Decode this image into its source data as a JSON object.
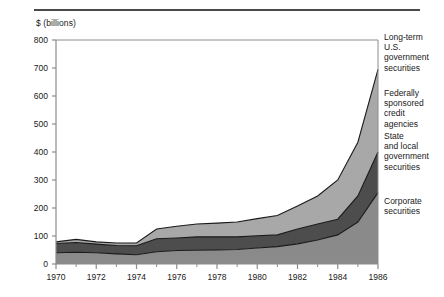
{
  "header": {
    "rule": true
  },
  "axes": {
    "ylabel": "$ (billions)",
    "yticks": [
      0,
      100,
      200,
      300,
      400,
      500,
      600,
      700,
      800
    ],
    "xticks": [
      1970,
      1972,
      1974,
      1976,
      1978,
      1980,
      1982,
      1984,
      1986
    ],
    "xticks_minor": [
      1971,
      1973,
      1975,
      1977,
      1979,
      1981,
      1983,
      1985
    ]
  },
  "legend": {
    "items": [
      {
        "label": "Long-term\nU.S.\ngovernment\nsecurities",
        "lines": [
          "Long-term",
          "U.S.",
          "government",
          "securities"
        ],
        "color": "#ffffff"
      },
      {
        "label": "Federally\nsponsored\ncredit\nagencies",
        "lines": [
          "Federally",
          "sponsored",
          "credit",
          "agencies"
        ],
        "color": "#a8a8a8"
      },
      {
        "label": "State\nand local\ngovernment\nsecurities",
        "lines": [
          "State",
          "and local",
          "government",
          "securities"
        ],
        "color": "#4d4d4d"
      },
      {
        "label": "Corporate\nsecurities",
        "lines": [
          "Corporate",
          "securities"
        ],
        "color": "#8a8a8a"
      }
    ]
  },
  "colors": {
    "corporate": "#8a8a8a",
    "state_local": "#4d4d4d",
    "federal_credit": "#a8a8a8",
    "longterm_govt": "#ffffff",
    "axis": "#8c8c8c",
    "outline": "#1a1a1a",
    "rule": "#4a4a4a",
    "text": "#1a1a1a"
  },
  "chart_data": {
    "type": "area",
    "title": "",
    "subtitle": "",
    "xlabel": "",
    "ylabel": "$ (billions)",
    "stacked": true,
    "grid": false,
    "legend_position": "right",
    "xlim": [
      1970,
      1986
    ],
    "ylim": [
      0,
      800
    ],
    "x": [
      1970,
      1971,
      1972,
      1973,
      1974,
      1975,
      1976,
      1977,
      1978,
      1979,
      1980,
      1981,
      1982,
      1983,
      1984,
      1985,
      1986
    ],
    "series": [
      {
        "name": "Corporate securities",
        "color": "#8a8a8a",
        "values": [
          40,
          42,
          40,
          36,
          33,
          44,
          48,
          49,
          50,
          52,
          57,
          62,
          72,
          86,
          104,
          150,
          255
        ]
      },
      {
        "name": "State and local government securities",
        "color": "#4d4d4d",
        "values": [
          33,
          35,
          31,
          30,
          32,
          46,
          45,
          48,
          47,
          45,
          44,
          42,
          53,
          57,
          56,
          93,
          145
        ]
      },
      {
        "name": "Federally sponsored credit agencies",
        "color": "#a8a8a8",
        "values": [
          6,
          11,
          8,
          9,
          10,
          35,
          42,
          46,
          49,
          53,
          61,
          69,
          82,
          100,
          140,
          192,
          295
        ]
      },
      {
        "name": "Long-term U.S. government securities",
        "color": "#ffffff",
        "values": [
          0,
          0,
          0,
          0,
          0,
          0,
          0,
          0,
          0,
          0,
          0,
          0,
          0,
          0,
          0,
          0,
          0
        ]
      }
    ],
    "totals": [
      79,
      88,
      79,
      75,
      75,
      125,
      135,
      143,
      146,
      150,
      162,
      173,
      207,
      243,
      300,
      435,
      695
    ]
  }
}
